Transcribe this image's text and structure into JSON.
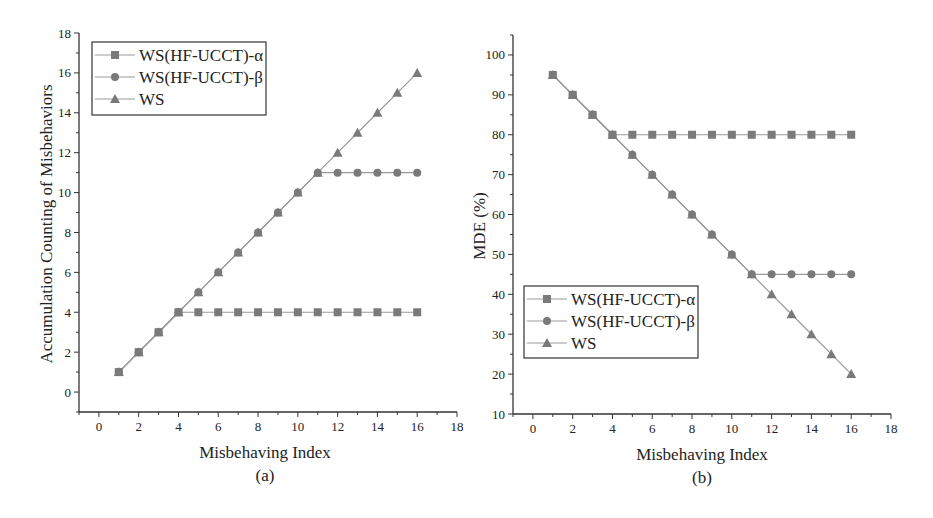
{
  "chart_data": [
    {
      "type": "line",
      "panel": "(a)",
      "title": "",
      "xlabel": "Misbehaving Index",
      "ylabel": "Accumulation Counting of Misbehaviors",
      "caption": "(a)",
      "xlim": [
        -1,
        18
      ],
      "ylim": [
        -1,
        18
      ],
      "xticks": [
        0,
        2,
        4,
        6,
        8,
        10,
        12,
        14,
        16,
        18
      ],
      "yticks": [
        0,
        2,
        4,
        6,
        8,
        10,
        12,
        14,
        16,
        18
      ],
      "grid": false,
      "legend_position": "upper-left",
      "x": [
        1,
        2,
        3,
        4,
        5,
        6,
        7,
        8,
        9,
        10,
        11,
        12,
        13,
        14,
        15,
        16
      ],
      "series": [
        {
          "name": "WS(HF-UCCT)-α",
          "marker": "square",
          "values": [
            1,
            2,
            3,
            4,
            4,
            4,
            4,
            4,
            4,
            4,
            4,
            4,
            4,
            4,
            4,
            4
          ]
        },
        {
          "name": "WS(HF-UCCT)-β",
          "marker": "circle",
          "values": [
            1,
            2,
            3,
            4,
            5,
            6,
            7,
            8,
            9,
            10,
            11,
            11,
            11,
            11,
            11,
            11
          ]
        },
        {
          "name": "WS",
          "marker": "triangle",
          "values": [
            1,
            2,
            3,
            4,
            5,
            6,
            7,
            8,
            9,
            10,
            11,
            12,
            13,
            14,
            15,
            16
          ]
        }
      ]
    },
    {
      "type": "line",
      "panel": "(b)",
      "title": "",
      "xlabel": "Misbehaving Index",
      "ylabel": "MDE (%)",
      "caption": "(b)",
      "xlim": [
        -1,
        18
      ],
      "ylim": [
        10,
        105
      ],
      "xticks": [
        0,
        2,
        4,
        6,
        8,
        10,
        12,
        14,
        16,
        18
      ],
      "yticks": [
        10,
        20,
        30,
        40,
        50,
        60,
        70,
        80,
        90,
        100
      ],
      "grid": false,
      "legend_position": "lower-left",
      "x": [
        1,
        2,
        3,
        4,
        5,
        6,
        7,
        8,
        9,
        10,
        11,
        12,
        13,
        14,
        15,
        16
      ],
      "series": [
        {
          "name": "WS(HF-UCCT)-α",
          "marker": "square",
          "values": [
            95,
            90,
            85,
            80,
            80,
            80,
            80,
            80,
            80,
            80,
            80,
            80,
            80,
            80,
            80,
            80
          ]
        },
        {
          "name": "WS(HF-UCCT)-β",
          "marker": "circle",
          "values": [
            95,
            90,
            85,
            80,
            75,
            70,
            65,
            60,
            55,
            50,
            45,
            45,
            45,
            45,
            45,
            45
          ]
        },
        {
          "name": "WS",
          "marker": "triangle",
          "values": [
            95,
            90,
            85,
            80,
            75,
            70,
            65,
            60,
            55,
            50,
            45,
            40,
            35,
            30,
            25,
            20
          ]
        }
      ]
    }
  ],
  "style": {
    "line_color": "#9a9a9a",
    "marker_color": "#7a7a7a",
    "axis_color": "#333333"
  }
}
